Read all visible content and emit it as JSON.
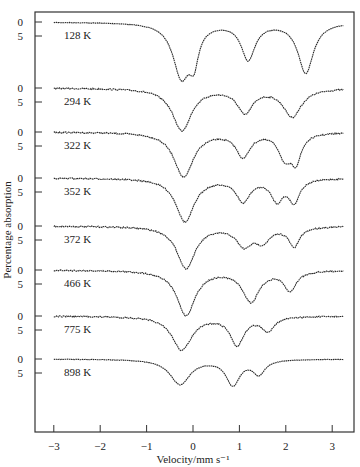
{
  "chart_data": {
    "type": "line",
    "title": "",
    "xlabel": "Velocity/mm s⁻¹",
    "ylabel": "Percentage absorption",
    "xlim": [
      -3.4,
      3.4
    ],
    "x_ticks": [
      -3,
      -2,
      -1,
      0,
      1,
      2,
      3
    ],
    "x_tick_labels": [
      "−3",
      "−2",
      "−1",
      "0",
      "1",
      "2",
      "3"
    ],
    "y_tick_labels_per_series": [
      "0",
      "5"
    ],
    "grid": false,
    "legend": "none (temperature labels placed beside each spectrum)",
    "series": [
      {
        "name": "128 K",
        "baseline_y": 22,
        "x_start": -3.0,
        "dips": [
          {
            "v": -0.25,
            "depth": 19,
            "width": 0.22
          },
          {
            "v": 0.02,
            "depth": 11,
            "width": 0.12
          },
          {
            "v": 1.19,
            "depth": 13,
            "width": 0.18
          },
          {
            "v": 2.43,
            "depth": 18,
            "width": 0.2
          }
        ]
      },
      {
        "name": "294 K",
        "baseline_y": 88,
        "x_start": -3.0,
        "dips": [
          {
            "v": -0.24,
            "depth": 15,
            "width": 0.25
          },
          {
            "v": 1.12,
            "depth": 8.5,
            "width": 0.2
          },
          {
            "v": 2.14,
            "depth": 10,
            "width": 0.24
          }
        ]
      },
      {
        "name": "322 K",
        "baseline_y": 132,
        "x_start": -3.0,
        "dips": [
          {
            "v": -0.2,
            "depth": 16,
            "width": 0.25
          },
          {
            "v": 1.08,
            "depth": 8.5,
            "width": 0.18
          },
          {
            "v": 1.98,
            "depth": 8.5,
            "width": 0.16
          },
          {
            "v": 2.22,
            "depth": 9.5,
            "width": 0.14
          }
        ]
      },
      {
        "name": "352 K",
        "baseline_y": 178,
        "x_start": -3.0,
        "dips": [
          {
            "v": -0.17,
            "depth": 15.5,
            "width": 0.24
          },
          {
            "v": 1.08,
            "depth": 8,
            "width": 0.18
          },
          {
            "v": 1.81,
            "depth": 7.5,
            "width": 0.16
          },
          {
            "v": 2.18,
            "depth": 8,
            "width": 0.14
          }
        ]
      },
      {
        "name": "372 K",
        "baseline_y": 226,
        "x_start": -3.0,
        "dips": [
          {
            "v": -0.15,
            "depth": 15,
            "width": 0.24
          },
          {
            "v": 1.1,
            "depth": 6.5,
            "width": 0.2
          },
          {
            "v": 1.5,
            "depth": 5,
            "width": 0.2
          },
          {
            "v": 2.18,
            "depth": 7,
            "width": 0.14
          }
        ]
      },
      {
        "name": "466 K",
        "baseline_y": 270,
        "x_start": -3.0,
        "dips": [
          {
            "v": -0.15,
            "depth": 16,
            "width": 0.24
          },
          {
            "v": 1.25,
            "depth": 11,
            "width": 0.22
          },
          {
            "v": 2.09,
            "depth": 7,
            "width": 0.16
          }
        ]
      },
      {
        "name": "775 K",
        "baseline_y": 316,
        "x_start": -3.0,
        "dips": [
          {
            "v": -0.24,
            "depth": 12,
            "width": 0.26
          },
          {
            "v": 0.95,
            "depth": 10,
            "width": 0.18
          },
          {
            "v": 1.61,
            "depth": 5,
            "width": 0.16
          }
        ]
      },
      {
        "name": "898 K",
        "baseline_y": 359,
        "x_start": -3.0,
        "dips": [
          {
            "v": -0.28,
            "depth": 9,
            "width": 0.26
          },
          {
            "v": 0.86,
            "depth": 9,
            "width": 0.18
          },
          {
            "v": 1.42,
            "depth": 5,
            "width": 0.16
          }
        ]
      }
    ]
  },
  "layout": {
    "frame": {
      "left": 35,
      "top": 12,
      "right": 354,
      "bottom": 432
    },
    "x_zero_px": 193,
    "px_per_mm_s": 46.4,
    "px_per_percent": 2.8,
    "ink_color": "#2a2a2a"
  }
}
